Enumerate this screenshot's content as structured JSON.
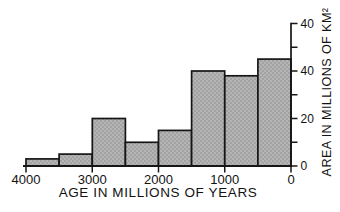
{
  "figure": {
    "background": "#ffffff",
    "line_color": "#161616",
    "bar_fill": "#b5b5b5",
    "bar_dot_color": "#898989"
  },
  "chart_data": {
    "type": "bar",
    "subtype": "histogram",
    "title": "",
    "xlabel": "AGE IN MILLIONS OF YEARS",
    "ylabel": "AREA IN MILLIONS OF KM²",
    "x_axis": {
      "min": 4000,
      "max": 0,
      "reversed": true,
      "tick_labels": [
        "4000",
        "3000",
        "2000",
        "1000",
        "0"
      ],
      "tick_values": [
        4000,
        3000,
        2000,
        1000,
        0
      ]
    },
    "y_axis": {
      "side": "right",
      "ylim": [
        0,
        60
      ],
      "ticks": [
        {
          "value": 0,
          "label": "0"
        },
        {
          "value": 10,
          "label": ""
        },
        {
          "value": 20,
          "label": "20"
        },
        {
          "value": 30,
          "label": ""
        },
        {
          "value": 40,
          "label": "40"
        },
        {
          "value": 50,
          "label": ""
        },
        {
          "value": 60,
          "label": "40"
        }
      ]
    },
    "bin_edges_age_my": [
      4000,
      3500,
      3000,
      2500,
      2000,
      1500,
      1000,
      500,
      0
    ],
    "values_area_mkm2": [
      3,
      5,
      20,
      10,
      15,
      40,
      38,
      45
    ],
    "grid": false,
    "legend": false
  }
}
